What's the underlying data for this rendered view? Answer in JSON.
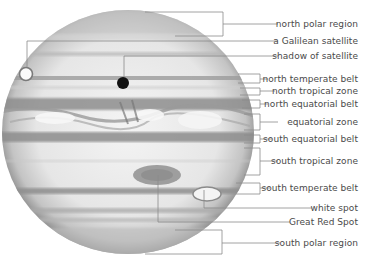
{
  "diagram": {
    "colors": {
      "background": "#ffffff",
      "planet_light": "#efefef",
      "planet_mid": "#c8c8c8",
      "planet_dark": "#8a8a8a",
      "leader_line": "#8c8c8c",
      "label_text": "#4a4a4a",
      "shadow_dot": "#111111"
    },
    "labels": [
      {
        "id": "north-polar-region",
        "text": "north polar region"
      },
      {
        "id": "galilean-satellite",
        "text": "a Galilean satellite"
      },
      {
        "id": "shadow-of-satellite",
        "text": "shadow of satellite"
      },
      {
        "id": "north-temperate-belt",
        "text": "north temperate belt"
      },
      {
        "id": "north-tropical-zone",
        "text": "north tropical zone"
      },
      {
        "id": "north-equatorial-belt",
        "text": "north equatorial belt"
      },
      {
        "id": "equatorial-zone",
        "text": "equatorial zone"
      },
      {
        "id": "south-equatorial-belt",
        "text": "south equatorial belt"
      },
      {
        "id": "south-tropical-zone",
        "text": "south tropical zone"
      },
      {
        "id": "south-temperate-belt",
        "text": "south temperate belt"
      },
      {
        "id": "white-spot",
        "text": "white spot"
      },
      {
        "id": "great-red-spot",
        "text": "Great Red Spot"
      },
      {
        "id": "south-polar-region",
        "text": "south polar region"
      }
    ]
  }
}
